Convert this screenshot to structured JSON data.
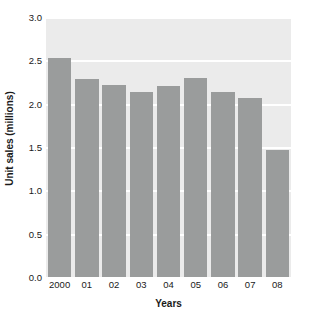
{
  "chart_data": {
    "type": "bar",
    "title": "",
    "xlabel": "Years",
    "ylabel": "Unit sales (millions)",
    "categories": [
      "2000",
      "01",
      "02",
      "03",
      "04",
      "05",
      "06",
      "07",
      "08"
    ],
    "values": [
      2.53,
      2.29,
      2.22,
      2.13,
      2.2,
      2.3,
      2.14,
      2.07,
      1.47
    ],
    "ylim": [
      0.0,
      3.0
    ],
    "y_ticks": [
      "0.0",
      "0.5",
      "1.0",
      "1.5",
      "2.0",
      "2.5",
      "3.0"
    ],
    "y_tick_values": [
      0.0,
      0.5,
      1.0,
      1.5,
      2.0,
      2.5,
      3.0
    ],
    "grid": true,
    "grid_axis": "y",
    "legend": null,
    "colors": {
      "bar": "#9a9c9c",
      "plot_background": "#ebebeb",
      "gridline": "#ffffff",
      "figure_background": "#ffffff",
      "text": "#1a1a1a"
    }
  }
}
